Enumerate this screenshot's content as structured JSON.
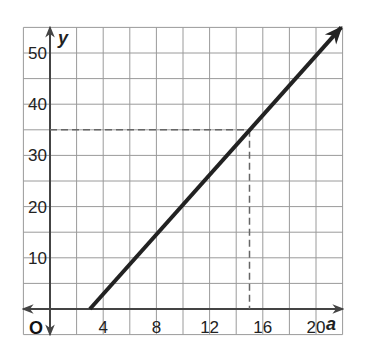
{
  "chart_data": {
    "type": "line",
    "title": "",
    "xlabel": "a",
    "ylabel": "y",
    "origin_label": "O",
    "xlim": [
      -2,
      22
    ],
    "ylim": [
      -5,
      55
    ],
    "grid": true,
    "x_ticks": [
      4,
      8,
      12,
      16,
      20
    ],
    "y_ticks": [
      10,
      20,
      30,
      40,
      50
    ],
    "x_tick_labels": [
      "4",
      "8",
      "12",
      "16",
      "20"
    ],
    "y_tick_labels": [
      "10",
      "20",
      "30",
      "40",
      "50"
    ],
    "grid_step_x": 2,
    "grid_step_y": 5,
    "series": [
      {
        "name": "line",
        "points": [
          [
            3,
            0
          ],
          [
            15,
            35
          ],
          [
            21.9,
            55
          ]
        ],
        "arrow_end": true,
        "color": "#222222"
      }
    ],
    "annotations": [
      {
        "type": "dashed-guide",
        "from": [
          0,
          35
        ],
        "to": [
          15,
          35
        ]
      },
      {
        "type": "dashed-guide",
        "from": [
          15,
          35
        ],
        "to": [
          15,
          0
        ]
      }
    ]
  }
}
